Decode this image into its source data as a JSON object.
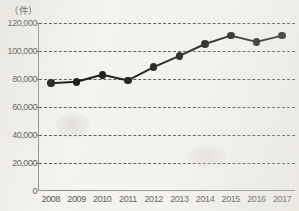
{
  "chart_data": {
    "type": "line",
    "title": "",
    "subtitle": "",
    "unit_label": "（件）",
    "xlabel": "",
    "ylabel": "",
    "ylim": [
      0,
      120000
    ],
    "ytick_labels": [
      "120,000",
      "100,000",
      "80,000",
      "60,000",
      "40,000",
      "20,000",
      "0"
    ],
    "ytick_values": [
      120000,
      100000,
      80000,
      60000,
      40000,
      20000,
      0
    ],
    "grid": "horizontal-dashed",
    "legend": "none",
    "marker": "filled-circle",
    "line_color": "#111110",
    "marker_color": "#111110",
    "categories": [
      "2008",
      "2009",
      "2010",
      "2011",
      "2012",
      "2013",
      "2014",
      "2015",
      "2016",
      "2017"
    ],
    "values": [
      77000,
      78000,
      83000,
      79000,
      88500,
      96500,
      105000,
      111000,
      106500,
      111000
    ],
    "series": [
      {
        "name": "件数",
        "values": [
          77000,
          78000,
          83000,
          79000,
          88500,
          96500,
          105000,
          111000,
          106500,
          111000
        ]
      }
    ]
  }
}
